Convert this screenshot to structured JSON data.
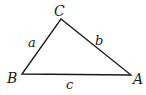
{
  "diagram": {
    "type": "triangle",
    "vertices": [
      {
        "name": "A",
        "x": 131,
        "y": 75
      },
      {
        "name": "B",
        "x": 22,
        "y": 74
      },
      {
        "name": "C",
        "x": 61,
        "y": 19
      }
    ],
    "vertex_labels": {
      "A": "A",
      "B": "B",
      "C": "C"
    },
    "side_labels": {
      "a": "a",
      "b": "b",
      "c": "c"
    },
    "line_color": "#1a1a1a",
    "text_color": "#1a1a1a"
  }
}
